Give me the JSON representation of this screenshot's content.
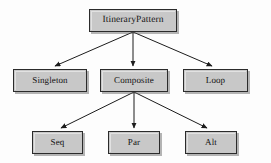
{
  "diagram": {
    "type": "hierarchy-tree",
    "title": "ItineraryPattern",
    "background_color": "#fdfdfd",
    "node_fill_color": "#c8c8c8",
    "node_border_color": "#2b2b2b",
    "edge_color": "#1c1c1c",
    "nodes": [
      {
        "id": "root",
        "label": "ItineraryPattern",
        "level": 1
      },
      {
        "id": "singleton",
        "label": "Singleton",
        "level": 2
      },
      {
        "id": "composite",
        "label": "Composite",
        "level": 2
      },
      {
        "id": "loop",
        "label": "Loop",
        "level": 2
      },
      {
        "id": "seq",
        "label": "Seq",
        "level": 3
      },
      {
        "id": "par",
        "label": "Par",
        "level": 3
      },
      {
        "id": "alt",
        "label": "Alt",
        "level": 3
      }
    ],
    "edges": [
      {
        "from": "root",
        "to": "singleton"
      },
      {
        "from": "root",
        "to": "composite"
      },
      {
        "from": "root",
        "to": "loop"
      },
      {
        "from": "composite",
        "to": "seq"
      },
      {
        "from": "composite",
        "to": "par"
      },
      {
        "from": "composite",
        "to": "alt"
      }
    ]
  }
}
